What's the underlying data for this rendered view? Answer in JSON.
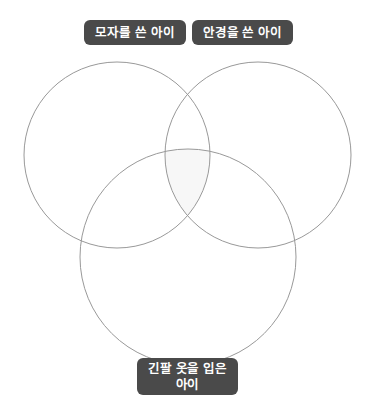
{
  "diagram": {
    "type": "venn-3-set",
    "background_color": "#ffffff",
    "circle_stroke_color": "#999999",
    "circle_stroke_width": 1,
    "intersection_fill_color": "#f7f7f7",
    "label_background_color": "#4a4a4a",
    "label_text_color": "#ffffff",
    "sets": [
      {
        "id": "hat",
        "label": "모자를 쓴 아이",
        "position": "top-left",
        "center_x": 117,
        "center_y": 155,
        "radius": 93
      },
      {
        "id": "glasses",
        "label": "안경을 쓴 아이",
        "position": "top-right",
        "center_x": 258,
        "center_y": 155,
        "radius": 93
      },
      {
        "id": "long-sleeve",
        "label": "긴팔 옷을 입은\n아이",
        "position": "bottom-center",
        "center_x": 188,
        "center_y": 257,
        "radius": 108
      }
    ]
  }
}
